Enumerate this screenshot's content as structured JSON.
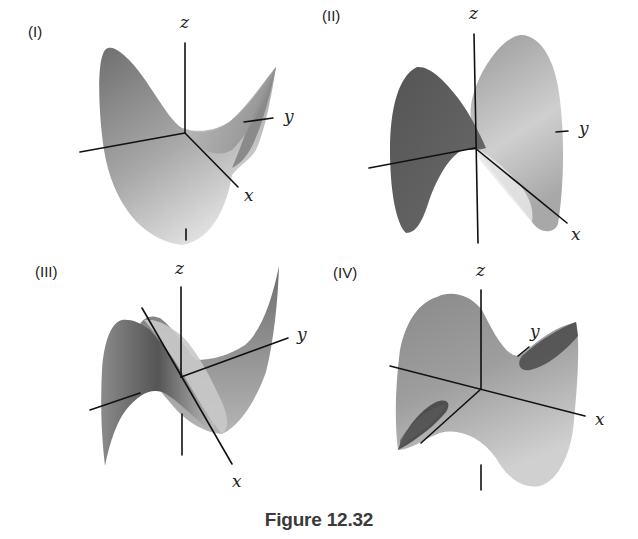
{
  "figure": {
    "caption": "Figure 12.32",
    "panels": [
      {
        "id": "I",
        "label": "(I)",
        "axis_labels": {
          "x": "x",
          "y": "y",
          "z": "z"
        },
        "description": "Saddle surface with high left peak and rising right wing"
      },
      {
        "id": "II",
        "label": "(II)",
        "axis_labels": {
          "x": "x",
          "y": "y",
          "z": "z"
        },
        "description": "Saddle with dark left lobe and light right lobe, viewed nearly edge-on"
      },
      {
        "id": "III",
        "label": "(III)",
        "axis_labels": {
          "x": "x",
          "y": "y",
          "z": "z"
        },
        "description": "Twisted cubic-like surface rising steeply to upper right"
      },
      {
        "id": "IV",
        "label": "(IV)",
        "axis_labels": {
          "x": "x",
          "y": "y",
          "z": "z"
        },
        "description": "Saddle surface with dark shaded valleys, x-axis toward right"
      }
    ]
  },
  "colors": {
    "background": "#ffffff",
    "axis": "#111111",
    "surface_dark": "#5e5e5e",
    "surface_mid": "#8f8f8f",
    "surface_light": "#d8d8d8"
  }
}
